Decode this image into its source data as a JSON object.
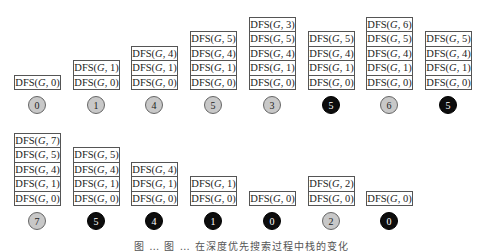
{
  "diagram": {
    "cell_prefix": "DFS(",
    "cell_graph": "G",
    "rows": [
      {
        "steps": [
          {
            "stack": [
              0
            ],
            "node": "0",
            "state": "visiting"
          },
          {
            "stack": [
              0,
              1
            ],
            "node": "1",
            "state": "visiting"
          },
          {
            "stack": [
              0,
              1,
              4
            ],
            "node": "4",
            "state": "visiting"
          },
          {
            "stack": [
              0,
              1,
              4,
              5
            ],
            "node": "5",
            "state": "visiting"
          },
          {
            "stack": [
              0,
              1,
              4,
              5,
              3
            ],
            "node": "3",
            "state": "visiting"
          },
          {
            "stack": [
              0,
              1,
              4,
              5
            ],
            "node": "5",
            "state": "finished"
          },
          {
            "stack": [
              0,
              1,
              4,
              5,
              6
            ],
            "node": "6",
            "state": "visiting"
          },
          {
            "stack": [
              0,
              1,
              4,
              5
            ],
            "node": "5",
            "state": "finished"
          }
        ]
      },
      {
        "steps": [
          {
            "stack": [
              0,
              1,
              4,
              5,
              7
            ],
            "node": "7",
            "state": "visiting"
          },
          {
            "stack": [
              0,
              1,
              4,
              5
            ],
            "node": "5",
            "state": "finished"
          },
          {
            "stack": [
              0,
              1,
              4
            ],
            "node": "4",
            "state": "finished"
          },
          {
            "stack": [
              0,
              1
            ],
            "node": "1",
            "state": "finished"
          },
          {
            "stack": [
              0
            ],
            "node": "0",
            "state": "finished"
          },
          {
            "stack": [
              0,
              2
            ],
            "node": "2",
            "state": "visiting"
          },
          {
            "stack": [
              0
            ],
            "node": "0",
            "state": "finished"
          }
        ]
      }
    ],
    "legend": {
      "visiting_color": "#c8c8c8",
      "finished_color": "#0d0d0d"
    }
  },
  "caption": "图 … 图 … 在深度优先搜索过程中栈的变化"
}
